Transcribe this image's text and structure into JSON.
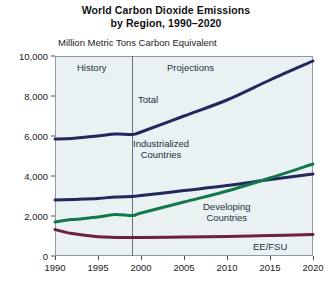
{
  "title": {
    "line1": "World Carbon Dioxide Emissions",
    "line2": "by Region, 1990–2020"
  },
  "axis_unit_label": "Million Metric Tons Carbon Equivalent",
  "annotations": {
    "history": "History",
    "projections": "Projections",
    "total": "Total",
    "industrialized_l1": "Industrialized",
    "industrialized_l2": "Countries",
    "developing_l1": "Developing",
    "developing_l2": "Countries",
    "eefsu": "EE/FSU"
  },
  "colors": {
    "total": "#23285c",
    "industrialized": "#23285c",
    "developing": "#13784b",
    "eefsu": "#6d2040",
    "plot_background": "#e9f1f3",
    "plot_border": "#8e9ba3",
    "divider": "#6d6f86"
  },
  "chart_data": {
    "type": "line",
    "title": "World Carbon Dioxide Emissions by Region, 1990–2020",
    "subtitle": "Million Metric Tons Carbon Equivalent",
    "xlabel": "",
    "ylabel": "Million Metric Tons Carbon Equivalent",
    "xlim": [
      1990,
      2020
    ],
    "ylim": [
      0,
      10000
    ],
    "xticks": [
      1990,
      1995,
      2000,
      2005,
      2010,
      2015,
      2020
    ],
    "xtick_labels": [
      "1990",
      "1995",
      "2000",
      "2005",
      "2010",
      "2015",
      "2020"
    ],
    "yticks": [
      0,
      2000,
      4000,
      6000,
      8000,
      10000
    ],
    "ytick_labels": [
      "0",
      "2,000",
      "4,000",
      "6,000",
      "8,000",
      "10,000"
    ],
    "grid": false,
    "legend": "inline-annotations",
    "history_projection_divider_year": 1999,
    "x": [
      1990,
      1992,
      1995,
      1997,
      1999,
      2000,
      2005,
      2010,
      2015,
      2020
    ],
    "series": [
      {
        "name": "Total",
        "color": "#23285c",
        "values": [
          5850,
          5880,
          6000,
          6100,
          6080,
          6200,
          7000,
          7800,
          8800,
          9750
        ]
      },
      {
        "name": "Industrialized Countries",
        "color": "#23285c",
        "values": [
          2800,
          2830,
          2880,
          2950,
          2980,
          3020,
          3270,
          3520,
          3820,
          4100
        ]
      },
      {
        "name": "Developing Countries",
        "color": "#13784b",
        "values": [
          1700,
          1820,
          1950,
          2080,
          2020,
          2150,
          2700,
          3250,
          3900,
          4600
        ]
      },
      {
        "name": "EE/FSU",
        "color": "#6d2040",
        "values": [
          1320,
          1120,
          960,
          930,
          920,
          930,
          950,
          980,
          1020,
          1070
        ]
      }
    ]
  }
}
